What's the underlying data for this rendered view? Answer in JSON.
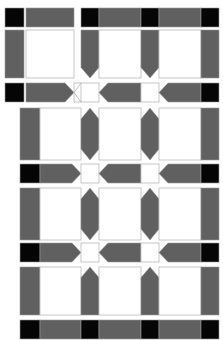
{
  "figure": {
    "canvas": {
      "width": 223,
      "height": 340,
      "background": "#ffffff"
    },
    "palette": {
      "gray": "#606060",
      "black": "#050505",
      "white": "#ffffff",
      "outline": "#b8b8b8"
    }
  },
  "chart_data": {
    "type": "diagram",
    "xlabel": "",
    "ylabel": "",
    "grid": false,
    "legend": null,
    "rows": [
      {
        "index": 1,
        "name": "top-band-row",
        "kind": "horizontal-band",
        "y": 8,
        "height": 19,
        "segments": [
          {
            "name": "left-black-cap",
            "type": "black-square",
            "x": 5,
            "width": 19
          },
          {
            "name": "left-gray-bar",
            "type": "gray-bar",
            "x": 26,
            "width": 48
          },
          {
            "name": "black-node-1",
            "type": "black-square",
            "x": 81,
            "width": 18
          },
          {
            "name": "gray-run-1",
            "type": "gray-bar",
            "x": 99,
            "width": 42
          },
          {
            "name": "black-node-2",
            "type": "black-square",
            "x": 141,
            "width": 18
          },
          {
            "name": "gray-run-2",
            "type": "gray-bar",
            "x": 159,
            "width": 42
          },
          {
            "name": "black-node-3",
            "type": "black-square",
            "x": 201,
            "width": 18
          }
        ]
      },
      {
        "index": 2,
        "name": "upper-column-row",
        "kind": "vertical-columns",
        "y": 30,
        "height": 48,
        "columns": [
          {
            "name": "left-panel-column",
            "type": "gray-column-flat",
            "x": 5,
            "width": 19
          },
          {
            "name": "left-panel-cell",
            "type": "white-cell",
            "x": 26,
            "width": 48
          },
          {
            "name": "column-arrow-down-1",
            "type": "gray-column-arrow-down",
            "x": 81,
            "width": 18
          },
          {
            "name": "white-cell-1",
            "type": "white-cell",
            "x": 99,
            "width": 42
          },
          {
            "name": "column-arrow-down-2",
            "type": "gray-column-arrow-down",
            "x": 141,
            "width": 18
          },
          {
            "name": "white-cell-2",
            "type": "white-cell",
            "x": 159,
            "width": 42
          },
          {
            "name": "right-column",
            "type": "gray-column-flat",
            "x": 201,
            "width": 18
          }
        ]
      },
      {
        "index": 3,
        "name": "arrow-band-row-1",
        "kind": "horizontal-band",
        "y": 83,
        "height": 19,
        "segments": [
          {
            "name": "left-black-cap",
            "type": "black-square",
            "x": 5,
            "width": 19
          },
          {
            "name": "arrow-right-1",
            "type": "gray-arrow-right",
            "x": 26,
            "width": 48
          },
          {
            "name": "notch-gap",
            "type": "white-notch",
            "x": 74,
            "width": 7
          },
          {
            "name": "white-gap-1",
            "type": "white-cell",
            "x": 81,
            "width": 18
          },
          {
            "name": "arrow-left-1",
            "type": "gray-arrow-left",
            "x": 99,
            "width": 42
          },
          {
            "name": "white-gap-2",
            "type": "white-cell",
            "x": 141,
            "width": 18
          },
          {
            "name": "arrow-left-2",
            "type": "gray-arrow-left",
            "x": 159,
            "width": 42
          },
          {
            "name": "right-black-cap",
            "type": "black-square",
            "x": 201,
            "width": 18
          }
        ]
      },
      {
        "index": 4,
        "name": "column-row-2",
        "kind": "vertical-columns",
        "y": 108,
        "height": 52,
        "columns": [
          {
            "name": "left-column",
            "type": "gray-column-flat",
            "x": 20,
            "width": 20
          },
          {
            "name": "white-cell-1",
            "type": "white-cell",
            "x": 40,
            "width": 41
          },
          {
            "name": "column-hex-1",
            "type": "gray-column-hex",
            "x": 81,
            "width": 18
          },
          {
            "name": "white-cell-2",
            "type": "white-cell",
            "x": 99,
            "width": 42
          },
          {
            "name": "column-hex-2",
            "type": "gray-column-hex",
            "x": 141,
            "width": 18
          },
          {
            "name": "white-cell-3",
            "type": "white-cell",
            "x": 159,
            "width": 42
          },
          {
            "name": "right-column",
            "type": "gray-column-flat",
            "x": 201,
            "width": 18
          }
        ]
      },
      {
        "index": 5,
        "name": "arrow-band-row-2",
        "kind": "horizontal-band",
        "y": 164,
        "height": 19,
        "segments": [
          {
            "name": "left-black-cap",
            "type": "black-square",
            "x": 20,
            "width": 20
          },
          {
            "name": "arrow-right-1",
            "type": "gray-arrow-right",
            "x": 40,
            "width": 41
          },
          {
            "name": "white-gap-1",
            "type": "white-cell",
            "x": 81,
            "width": 18
          },
          {
            "name": "arrow-left-1",
            "type": "gray-arrow-left",
            "x": 99,
            "width": 42
          },
          {
            "name": "white-gap-2",
            "type": "white-cell",
            "x": 141,
            "width": 18
          },
          {
            "name": "arrow-left-2",
            "type": "gray-arrow-left",
            "x": 159,
            "width": 42
          },
          {
            "name": "right-black-cap",
            "type": "black-square",
            "x": 201,
            "width": 18
          }
        ]
      },
      {
        "index": 6,
        "name": "column-row-3",
        "kind": "vertical-columns",
        "y": 188,
        "height": 52,
        "columns": [
          {
            "name": "left-column",
            "type": "gray-column-flat",
            "x": 20,
            "width": 20
          },
          {
            "name": "white-cell-1",
            "type": "white-cell",
            "x": 40,
            "width": 41
          },
          {
            "name": "column-hex-1",
            "type": "gray-column-hex",
            "x": 81,
            "width": 18
          },
          {
            "name": "white-cell-2",
            "type": "white-cell",
            "x": 99,
            "width": 42
          },
          {
            "name": "column-hex-2",
            "type": "gray-column-hex",
            "x": 141,
            "width": 18
          },
          {
            "name": "white-cell-3",
            "type": "white-cell",
            "x": 159,
            "width": 42
          },
          {
            "name": "right-column",
            "type": "gray-column-flat",
            "x": 201,
            "width": 18
          }
        ]
      },
      {
        "index": 7,
        "name": "arrow-band-row-3",
        "kind": "horizontal-band",
        "y": 243,
        "height": 19,
        "segments": [
          {
            "name": "left-black-cap",
            "type": "black-square",
            "x": 20,
            "width": 20
          },
          {
            "name": "arrow-right-1",
            "type": "gray-arrow-right",
            "x": 40,
            "width": 41
          },
          {
            "name": "white-gap-1",
            "type": "white-cell",
            "x": 81,
            "width": 18
          },
          {
            "name": "arrow-left-1",
            "type": "gray-arrow-left",
            "x": 99,
            "width": 42
          },
          {
            "name": "white-gap-2",
            "type": "white-cell",
            "x": 141,
            "width": 18
          },
          {
            "name": "arrow-left-2",
            "type": "gray-arrow-left",
            "x": 159,
            "width": 42
          },
          {
            "name": "right-black-cap",
            "type": "black-square",
            "x": 201,
            "width": 18
          }
        ]
      },
      {
        "index": 8,
        "name": "column-row-4",
        "kind": "vertical-columns",
        "y": 267,
        "height": 48,
        "columns": [
          {
            "name": "left-column",
            "type": "gray-column-flat",
            "x": 20,
            "width": 20
          },
          {
            "name": "white-cell-1",
            "type": "white-cell",
            "x": 40,
            "width": 41
          },
          {
            "name": "column-arrow-up-1",
            "type": "gray-column-arrow-up",
            "x": 81,
            "width": 18
          },
          {
            "name": "white-cell-2",
            "type": "white-cell",
            "x": 99,
            "width": 42
          },
          {
            "name": "column-arrow-up-2",
            "type": "gray-column-arrow-up",
            "x": 141,
            "width": 18
          },
          {
            "name": "white-cell-3",
            "type": "white-cell",
            "x": 159,
            "width": 42
          },
          {
            "name": "right-column",
            "type": "gray-column-flat",
            "x": 201,
            "width": 18
          }
        ]
      },
      {
        "index": 9,
        "name": "bottom-band-row",
        "kind": "horizontal-band",
        "y": 320,
        "height": 19,
        "segments": [
          {
            "name": "left-black-cap",
            "type": "black-square",
            "x": 20,
            "width": 20
          },
          {
            "name": "gray-run-1",
            "type": "gray-bar",
            "x": 40,
            "width": 41
          },
          {
            "name": "black-node-1",
            "type": "black-square",
            "x": 81,
            "width": 18
          },
          {
            "name": "gray-run-2",
            "type": "gray-bar",
            "x": 99,
            "width": 42
          },
          {
            "name": "black-node-2",
            "type": "black-square",
            "x": 141,
            "width": 18
          },
          {
            "name": "gray-run-3",
            "type": "gray-bar",
            "x": 159,
            "width": 42
          },
          {
            "name": "black-node-3",
            "type": "black-square",
            "x": 201,
            "width": 18
          }
        ]
      }
    ]
  }
}
